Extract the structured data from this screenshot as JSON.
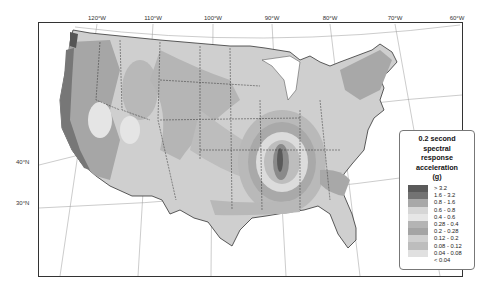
{
  "map": {
    "title": "0.2 second spectral response acceleration (g)",
    "longitude_labels": [
      {
        "label": "120°W",
        "x": 97
      },
      {
        "label": "110°W",
        "x": 153
      },
      {
        "label": "100°W",
        "x": 213
      },
      {
        "label": "90°W",
        "x": 272
      },
      {
        "label": "80°W",
        "x": 330
      },
      {
        "label": "70°W",
        "x": 395
      },
      {
        "label": "60°W",
        "x": 457
      }
    ],
    "latitude_labels": [
      {
        "label": "40°N",
        "y": 162
      },
      {
        "label": "30°N",
        "y": 203
      }
    ]
  },
  "legend": {
    "title_lines": [
      "0.2 second",
      "spectral",
      "response",
      "acceleration",
      "(g)"
    ],
    "items": [
      {
        "label": "> 3.2",
        "color": "#5a5a5a"
      },
      {
        "label": "1.6 - 3.2",
        "color": "#737373"
      },
      {
        "label": "0.8 - 1.6",
        "color": "#a8a8a8"
      },
      {
        "label": "0.6 - 0.8",
        "color": "#d6d6d6"
      },
      {
        "label": "0.4 - 0.6",
        "color": "#e6e6e6"
      },
      {
        "label": "0.28 - 0.4",
        "color": "#b4b4b4"
      },
      {
        "label": "0.2 - 0.28",
        "color": "#a4a4a4"
      },
      {
        "label": "0.12 - 0.2",
        "color": "#cfcfcf"
      },
      {
        "label": "0.08 - 0.12",
        "color": "#bdbdbd"
      },
      {
        "label": "0.04 - 0.08",
        "color": "#e0e0e0"
      },
      {
        "label": "< 0.04",
        "color": "#ffffff"
      }
    ]
  }
}
